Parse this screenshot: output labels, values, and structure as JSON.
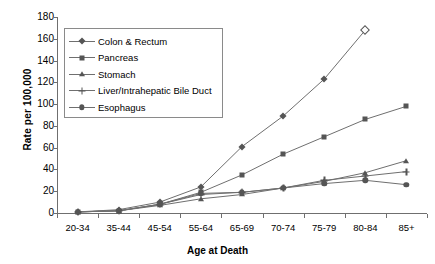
{
  "chart_data": {
    "type": "line",
    "title": "",
    "xlabel": "Age at Death",
    "ylabel": "Rate per 100,000",
    "categories": [
      "20-34",
      "35-44",
      "45-54",
      "55-64",
      "65-69",
      "70-74",
      "75-79",
      "80-84",
      "85+"
    ],
    "ylim": [
      0,
      180
    ],
    "yticks": [
      0,
      20,
      40,
      60,
      80,
      100,
      120,
      140,
      160,
      180
    ],
    "grid": false,
    "legend_position": "upper-left-inside",
    "series": [
      {
        "name": "Colon & Rectum",
        "marker": "diamond",
        "values": [
          1,
          3,
          10,
          24,
          61,
          89,
          123,
          168,
          null
        ]
      },
      {
        "name": "Pancreas",
        "marker": "square",
        "values": [
          1,
          2,
          8,
          19,
          35,
          54,
          70,
          86,
          98
        ]
      },
      {
        "name": "Stomach",
        "marker": "triangle",
        "values": [
          1,
          2,
          7,
          13,
          17,
          23,
          29,
          37,
          48
        ]
      },
      {
        "name": "Liver/Intrahepatic Bile Duct",
        "marker": "cross",
        "values": [
          1,
          2,
          8,
          17,
          19,
          23,
          30,
          34,
          38
        ]
      },
      {
        "name": "Esophagus",
        "marker": "circle",
        "values": [
          1,
          2,
          8,
          18,
          19,
          23,
          27,
          30,
          26
        ]
      }
    ]
  },
  "axes": {
    "y_tick_labels": [
      "180",
      "160",
      "140",
      "120",
      "100",
      "80",
      "60",
      "40",
      "20",
      "0"
    ],
    "x_tick_labels": [
      "20-34",
      "35-44",
      "45-54",
      "55-64",
      "65-69",
      "70-74",
      "75-79",
      "80-84",
      "85+"
    ],
    "y_axis_title": "Rate per 100,000",
    "x_axis_title": "Age at Death"
  },
  "legend": {
    "items": [
      {
        "label": "Colon & Rectum",
        "marker": "diamond"
      },
      {
        "label": "Pancreas",
        "marker": "square"
      },
      {
        "label": "Stomach",
        "marker": "triangle"
      },
      {
        "label": "Liver/Intrahepatic Bile Duct",
        "marker": "cross"
      },
      {
        "label": "Esophagus",
        "marker": "circle"
      }
    ]
  },
  "colors": {
    "line": "#6f6f6f",
    "marker": "#555555",
    "axis": "#6f6f6f",
    "text": "#000000",
    "background": "#ffffff"
  }
}
